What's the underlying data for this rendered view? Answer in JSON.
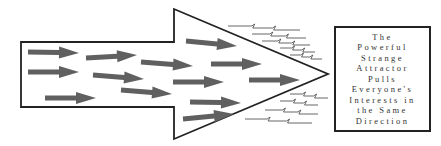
{
  "diagram": {
    "caption_lines": [
      "The",
      "Powerful",
      "Strange",
      "Attractor",
      "Pulls",
      "Everyone's",
      "Interests in",
      "the Same",
      "Direction"
    ],
    "colors": {
      "outline": "#222222",
      "inner_arrows": "#606060",
      "zigzag": "#555555",
      "background": "#ffffff"
    },
    "big_arrow": {
      "shaft": {
        "left": 21,
        "top": 42,
        "bottom": 107
      },
      "head": {
        "base_x": 174,
        "top": 9,
        "bottom": 139,
        "tip_x": 328,
        "tip_y": 74
      }
    },
    "inner_arrows": [
      {
        "x1": 28,
        "y1": 52,
        "x2": 79,
        "y2": 53
      },
      {
        "x1": 28,
        "y1": 72,
        "x2": 79,
        "y2": 72
      },
      {
        "x1": 45,
        "y1": 98,
        "x2": 96,
        "y2": 98
      },
      {
        "x1": 86,
        "y1": 58,
        "x2": 137,
        "y2": 55
      },
      {
        "x1": 93,
        "y1": 75,
        "x2": 144,
        "y2": 79
      },
      {
        "x1": 121,
        "y1": 90,
        "x2": 172,
        "y2": 94
      },
      {
        "x1": 141,
        "y1": 62,
        "x2": 193,
        "y2": 66
      },
      {
        "x1": 173,
        "y1": 82,
        "x2": 224,
        "y2": 82
      },
      {
        "x1": 186,
        "y1": 41,
        "x2": 237,
        "y2": 46
      },
      {
        "x1": 190,
        "y1": 102,
        "x2": 241,
        "y2": 103
      },
      {
        "x1": 183,
        "y1": 119,
        "x2": 234,
        "y2": 114
      },
      {
        "x1": 211,
        "y1": 64,
        "x2": 262,
        "y2": 64
      },
      {
        "x1": 249,
        "y1": 80,
        "x2": 300,
        "y2": 80
      }
    ],
    "zigzags": [
      {
        "x1": 228,
        "x2": 300,
        "y": 26
      },
      {
        "x1": 252,
        "x2": 306,
        "y": 34
      },
      {
        "x1": 262,
        "x2": 310,
        "y": 41
      },
      {
        "x1": 280,
        "x2": 315,
        "y": 48
      },
      {
        "x1": 290,
        "x2": 322,
        "y": 55
      },
      {
        "x1": 290,
        "x2": 328,
        "y": 94
      },
      {
        "x1": 280,
        "x2": 318,
        "y": 101
      },
      {
        "x1": 265,
        "x2": 318,
        "y": 110
      },
      {
        "x1": 245,
        "x2": 312,
        "y": 119
      }
    ]
  }
}
